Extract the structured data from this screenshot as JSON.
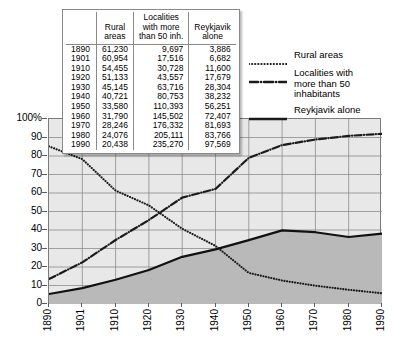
{
  "chart_data": {
    "type": "line",
    "title": "",
    "xlabel": "",
    "ylabel": "",
    "ylim": [
      0,
      100
    ],
    "ytick_labels": [
      "100%",
      "90",
      "80",
      "70",
      "60",
      "50",
      "40",
      "30",
      "20",
      "10",
      "0"
    ],
    "ytick_values": [
      100,
      90,
      80,
      70,
      60,
      50,
      40,
      30,
      20,
      10,
      0
    ],
    "grid": true,
    "legend_position": "top-right",
    "categories": [
      "1890",
      "1901",
      "1910",
      "1920",
      "1930",
      "1940",
      "1950",
      "1960",
      "1970",
      "1980",
      "1990"
    ],
    "x": [
      1890,
      1901,
      1910,
      1920,
      1930,
      1940,
      1950,
      1960,
      1970,
      1980,
      1990
    ],
    "series": [
      {
        "name": "Rural areas",
        "style": "dotted",
        "color": "#1a1a1a",
        "counts": [
          61230,
          60954,
          54455,
          51133,
          45145,
          40721,
          33580,
          31790,
          28246,
          24076,
          20438
        ],
        "values": [
          85.2,
          78.3,
          61.3,
          53.3,
          40.7,
          31.4,
          16.8,
          12.7,
          9.9,
          7.7,
          5.8
        ]
      },
      {
        "name": "Localities with more than 50 inhabitants",
        "style": "dash-dot",
        "color": "#1a1a1a",
        "counts": [
          9697,
          17516,
          30728,
          43557,
          63716,
          80753,
          110393,
          145502,
          176332,
          205111,
          235270
        ],
        "values": [
          13.5,
          22.5,
          34.6,
          45.4,
          57.5,
          62.2,
          79.0,
          85.9,
          88.9,
          90.9,
          92.0
        ]
      },
      {
        "name": "Reykjavik alone",
        "style": "solid",
        "color": "#111111",
        "filled": true,
        "counts": [
          3886,
          6682,
          11600,
          17679,
          28304,
          38232,
          56251,
          72407,
          81693,
          83766,
          97569
        ],
        "values": [
          5.4,
          8.6,
          13.1,
          18.4,
          25.5,
          29.5,
          34.5,
          39.8,
          38.8,
          36.2,
          38.1
        ]
      }
    ]
  },
  "data_table": {
    "headers": [
      "",
      "Rural areas",
      "Localities with more than 50 inh.",
      "Reykjavik alone"
    ],
    "header_lines": [
      [
        ""
      ],
      [
        "Rural",
        "areas"
      ],
      [
        "Localities",
        "with more",
        "than 50 inh."
      ],
      [
        "Reykjavik",
        "alone"
      ]
    ],
    "rows": [
      {
        "year": "1890",
        "rural": "61,230",
        "localities": "9,697",
        "reykjavik": "3,886"
      },
      {
        "year": "1901",
        "rural": "60,954",
        "localities": "17,516",
        "reykjavik": "6,682"
      },
      {
        "year": "1910",
        "rural": "54,455",
        "localities": "30,728",
        "reykjavik": "11,600"
      },
      {
        "year": "1920",
        "rural": "51,133",
        "localities": "43,557",
        "reykjavik": "17,679"
      },
      {
        "year": "1930",
        "rural": "45,145",
        "localities": "63,716",
        "reykjavik": "28,304"
      },
      {
        "year": "1940",
        "rural": "40,721",
        "localities": "80,753",
        "reykjavik": "38,232"
      },
      {
        "year": "1950",
        "rural": "33,580",
        "localities": "110,393",
        "reykjavik": "56,251"
      },
      {
        "year": "1960",
        "rural": "31,790",
        "localities": "145,502",
        "reykjavik": "72,407"
      },
      {
        "year": "1970",
        "rural": "28,246",
        "localities": "176,332",
        "reykjavik": "81,693"
      },
      {
        "year": "1980",
        "rural": "24,076",
        "localities": "205,111",
        "reykjavik": "83,766"
      },
      {
        "year": "1990",
        "rural": "20,438",
        "localities": "235,270",
        "reykjavik": "97,569"
      }
    ]
  },
  "legend": {
    "items": [
      {
        "label": "Rural areas",
        "style": "dotted"
      },
      {
        "label": "Localities with\nmore than 50 inhabitants",
        "style": "dash-dot"
      },
      {
        "label": "Reykjavik alone",
        "style": "solid"
      }
    ]
  },
  "colors": {
    "plot_background": "#e8e8e8",
    "area_fill": "#b9b9b9",
    "gridline": "#8c8c8c",
    "line": "#1a1a1a",
    "frame": "#7a7a7a",
    "page_background": "#ffffff"
  }
}
